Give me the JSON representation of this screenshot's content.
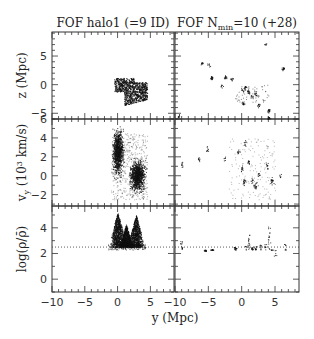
{
  "chart_data": {
    "type": "scatter",
    "layout": "3x2 grid of panels sharing axes",
    "columns": [
      {
        "title": "FOF halo1 (=9 ID)"
      },
      {
        "title": "FOF N",
        "title_subscript": "min",
        "title_suffix": "=10 (+28)"
      }
    ],
    "rows": [
      {
        "ylabel": "z (Mpc)",
        "yticks": [
          -5,
          0,
          5
        ],
        "ylim": [
          -6,
          9.2
        ],
        "extra_tick_label": "6"
      },
      {
        "ylabel": "v_y (10^3 km/s)",
        "ylabel_main": "v",
        "ylabel_sub": "y",
        "ylabel_rest": " (10",
        "ylabel_sup": "3",
        "ylabel_end": " km/s)",
        "yticks": [
          -2,
          0,
          2,
          4,
          6
        ],
        "ylim": [
          -3.2,
          6
        ]
      },
      {
        "ylabel": "log(ρ/ρ̄)",
        "yticks": [
          0,
          2,
          4
        ],
        "ylim": [
          -1,
          5.7
        ],
        "threshold_line": 2.5
      }
    ],
    "xlabel": "y (Mpc)",
    "xticks_left": [
      -10,
      -5,
      0,
      5
    ],
    "xticks_right": [
      -10,
      -5,
      0,
      5
    ],
    "xlim": [
      -10,
      8.6
    ],
    "grid": false,
    "legend": "none",
    "annotations": [
      "dotted horizontal line at log(ρ/ρ̄) ≈ 2.5 in bottom panels"
    ],
    "series": [
      {
        "name": "halo1 z-y",
        "panel": [
          0,
          0
        ],
        "cluster_center": [
          1.5,
          -0.8
        ],
        "extent_x": [
          -1,
          4.5
        ],
        "extent_y": [
          -3.5,
          1.2
        ]
      },
      {
        "name": "halo1 vy-y",
        "panel": [
          1,
          0
        ],
        "clusters": [
          {
            "x": 0,
            "y": 2.5,
            "sx": 0.5,
            "sy": 1.5
          },
          {
            "x": 3,
            "y": 0,
            "sx": 0.7,
            "sy": 1.0
          }
        ],
        "extent_x": [
          -1.5,
          4.5
        ],
        "extent_y": [
          -2.5,
          5
        ]
      },
      {
        "name": "halo1 density peaks",
        "panel": [
          2,
          0
        ],
        "peaks": [
          {
            "x": 0,
            "y": 5.2
          },
          {
            "x": 1.3,
            "y": 4.3
          },
          {
            "x": 2.8,
            "y": 5.0
          }
        ],
        "base": 2.5
      },
      {
        "name": "Nmin=10 groups z-y",
        "panel": [
          0,
          1
        ],
        "points": [
          [
            -9.5,
            -5.5
          ],
          [
            -6,
            3.8
          ],
          [
            -5,
            3.6
          ],
          [
            -4.5,
            1.2
          ],
          [
            -2.5,
            1.3
          ],
          [
            -3,
            -0.2
          ],
          [
            -1.5,
            1
          ],
          [
            0,
            -1
          ],
          [
            0.5,
            -0.5
          ],
          [
            1,
            -1.2
          ],
          [
            1.5,
            -2
          ],
          [
            2,
            -1.5
          ],
          [
            0.2,
            -3.2
          ],
          [
            2.5,
            -3.5
          ],
          [
            4,
            -4.5
          ],
          [
            3.5,
            7
          ],
          [
            6.2,
            2.8
          ],
          [
            4,
            -5.8
          ]
        ]
      },
      {
        "name": "Nmin=10 groups vy-y",
        "panel": [
          1,
          1
        ],
        "points": [
          [
            -9,
            1.2
          ],
          [
            -6.5,
            1.8
          ],
          [
            -5.2,
            2.8
          ],
          [
            -2.5,
            1.8
          ],
          [
            0,
            0.8
          ],
          [
            0.3,
            -0.6
          ],
          [
            1.5,
            -0.5
          ],
          [
            2.5,
            0.2
          ],
          [
            3.8,
            1
          ],
          [
            4.5,
            -0.5
          ],
          [
            5.8,
            0
          ],
          [
            2,
            -1
          ],
          [
            -0.5,
            2.5
          ],
          [
            0.5,
            3.5
          ],
          [
            1,
            1.5
          ]
        ]
      },
      {
        "name": "Nmin=10 groups density",
        "panel": [
          2,
          1
        ],
        "points": [
          [
            -9,
            3
          ],
          [
            -5.5,
            2.2
          ],
          [
            -4.5,
            2.3
          ],
          [
            -1,
            2.5
          ],
          [
            0.5,
            2.6
          ],
          [
            1,
            3.5
          ],
          [
            1.5,
            2.5
          ],
          [
            2,
            2.6
          ],
          [
            2.8,
            2.7
          ],
          [
            3.5,
            2.8
          ],
          [
            4,
            4.1
          ],
          [
            4.5,
            2.3
          ],
          [
            6.5,
            2.8
          ],
          [
            5,
            1.8
          ]
        ]
      }
    ]
  }
}
